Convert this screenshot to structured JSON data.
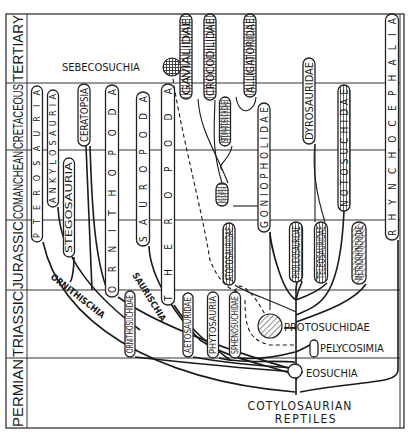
{
  "diagram": {
    "type": "phylogenetic-tree",
    "root_label_line1": "COTYLOSAURIAN",
    "root_label_line2": "REPTILES",
    "periods": [
      {
        "label": "TERTIARY",
        "y_top": 14,
        "y_bottom": 83
      },
      {
        "label": "CRETACEOUS",
        "y_top": 83,
        "y_bottom": 150
      },
      {
        "label": "COMANCHEAN",
        "y_top": 150,
        "y_bottom": 220
      },
      {
        "label": "JURASSIC",
        "y_top": 220,
        "y_bottom": 290
      },
      {
        "label": "TRIASSIC",
        "y_top": 290,
        "y_bottom": 358
      },
      {
        "label": "PERMIAN",
        "y_top": 358,
        "y_bottom": 428
      }
    ],
    "groups": [
      {
        "name": "PTEROSAURIA",
        "x": 37,
        "y1": 86,
        "y2": 242,
        "w": 11,
        "style": "plain",
        "spaced": true
      },
      {
        "name": "ANKYLOSAURIA",
        "x": 53,
        "y1": 90,
        "y2": 207,
        "w": 11,
        "style": "plain",
        "spaced": true
      },
      {
        "name": "STEGOSAURIA",
        "x": 69,
        "y1": 158,
        "y2": 257,
        "w": 11,
        "style": "plain",
        "spaced": false
      },
      {
        "name": "CERATOPSIA",
        "x": 84,
        "y1": 84,
        "y2": 146,
        "w": 12,
        "style": "plain",
        "spaced": false
      },
      {
        "name": "ORNITHOPODA",
        "x": 112,
        "y1": 85,
        "y2": 297,
        "w": 13,
        "style": "plain",
        "spaced": true
      },
      {
        "name": "SAUROPODA",
        "x": 143,
        "y1": 92,
        "y2": 246,
        "w": 13,
        "style": "plain",
        "spaced": true
      },
      {
        "name": "THERODODA",
        "x": 168,
        "y1": 84,
        "y2": 305,
        "w": 13,
        "style": "plain",
        "spaced": true
      },
      {
        "name": "ORNITHOSUCHIDAE",
        "x": 130,
        "y1": 291,
        "y2": 357,
        "w": 10,
        "style": "plain",
        "spaced": false
      },
      {
        "name": "AETOSAURIDAE",
        "x": 188,
        "y1": 293,
        "y2": 357,
        "w": 10,
        "style": "plain",
        "spaced": false
      },
      {
        "name": "PHYTOSAURIA",
        "x": 213,
        "y1": 292,
        "y2": 358,
        "w": 11,
        "style": "plain",
        "spaced": false
      },
      {
        "name": "SPHENOSUCHIDAE",
        "x": 235,
        "y1": 292,
        "y2": 358,
        "w": 11,
        "style": "plain",
        "spaced": false
      },
      {
        "name": "ATOPOSAURIDAE",
        "x": 229,
        "y1": 223,
        "y2": 285,
        "w": 12,
        "style": "vlines",
        "spaced": false
      },
      {
        "name": "GAVIALIDAE",
        "x": 186,
        "y1": 14,
        "y2": 99,
        "w": 12,
        "style": "hlines",
        "spaced": false
      },
      {
        "name": "CROCODILIDAE",
        "x": 210,
        "y1": 14,
        "y2": 100,
        "w": 12,
        "style": "hlines",
        "spaced": false
      },
      {
        "name": "STOMATOSUCHIDAE",
        "x": 225,
        "y1": 97,
        "y2": 146,
        "w": 11,
        "style": "hlines",
        "spaced": false
      },
      {
        "name": "ALLIGATORIDAE",
        "x": 250,
        "y1": 14,
        "y2": 97,
        "w": 12,
        "style": "hlines",
        "spaced": false
      },
      {
        "name": "HYLAEOCHAMPSIDAE",
        "x": 222,
        "y1": 183,
        "y2": 206,
        "w": 12,
        "style": "hlines",
        "spaced": false
      },
      {
        "name": "GONIOPHOLIDAE",
        "x": 264,
        "y1": 103,
        "y2": 232,
        "w": 12,
        "style": "plain",
        "spaced": true
      },
      {
        "name": "PHOLIDOSAURIDAE",
        "x": 296,
        "y1": 222,
        "y2": 282,
        "w": 13,
        "style": "vlines",
        "spaced": false
      },
      {
        "name": "TELEOSAURIDAE",
        "x": 321,
        "y1": 222,
        "y2": 283,
        "w": 13,
        "style": "vlines",
        "spaced": false
      },
      {
        "name": "DYROSAURIDAE",
        "x": 309,
        "y1": 58,
        "y2": 144,
        "w": 12,
        "style": "plain",
        "spaced": false
      },
      {
        "name": "NOTOSUCHIDAE",
        "x": 344,
        "y1": 85,
        "y2": 211,
        "w": 12,
        "style": "vlines",
        "spaced": true
      },
      {
        "name": "METRIORHYNCHIDAE",
        "x": 359,
        "y1": 222,
        "y2": 284,
        "w": 14,
        "style": "diag",
        "spaced": false
      },
      {
        "name": "RHYNCHOCEPHALIA",
        "x": 392,
        "y1": 14,
        "y2": 240,
        "w": 13,
        "style": "plain",
        "spaced": true
      }
    ],
    "side_labels": [
      {
        "text": "SEBECOSUCHIA",
        "x": 62,
        "y": 67
      },
      {
        "text": "PROTOSUCHIDAE",
        "x": 284,
        "y": 327
      },
      {
        "text": "PELYCOSIMIA",
        "x": 320,
        "y": 348
      },
      {
        "text": "EOSUCHIA",
        "x": 306,
        "y": 373
      }
    ],
    "branch_labels": [
      {
        "text": "ORNITHISCHIA",
        "x": 50,
        "y": 278,
        "angle": 38
      },
      {
        "text": "SAURISCHIA",
        "x": 132,
        "y": 275,
        "angle": 58
      }
    ],
    "corrected_names": {
      "THERODODA": "THEROPODA"
    }
  },
  "colors": {
    "ink": "#1a1a1a",
    "paper": "#ffffff",
    "grid": "#333333"
  }
}
